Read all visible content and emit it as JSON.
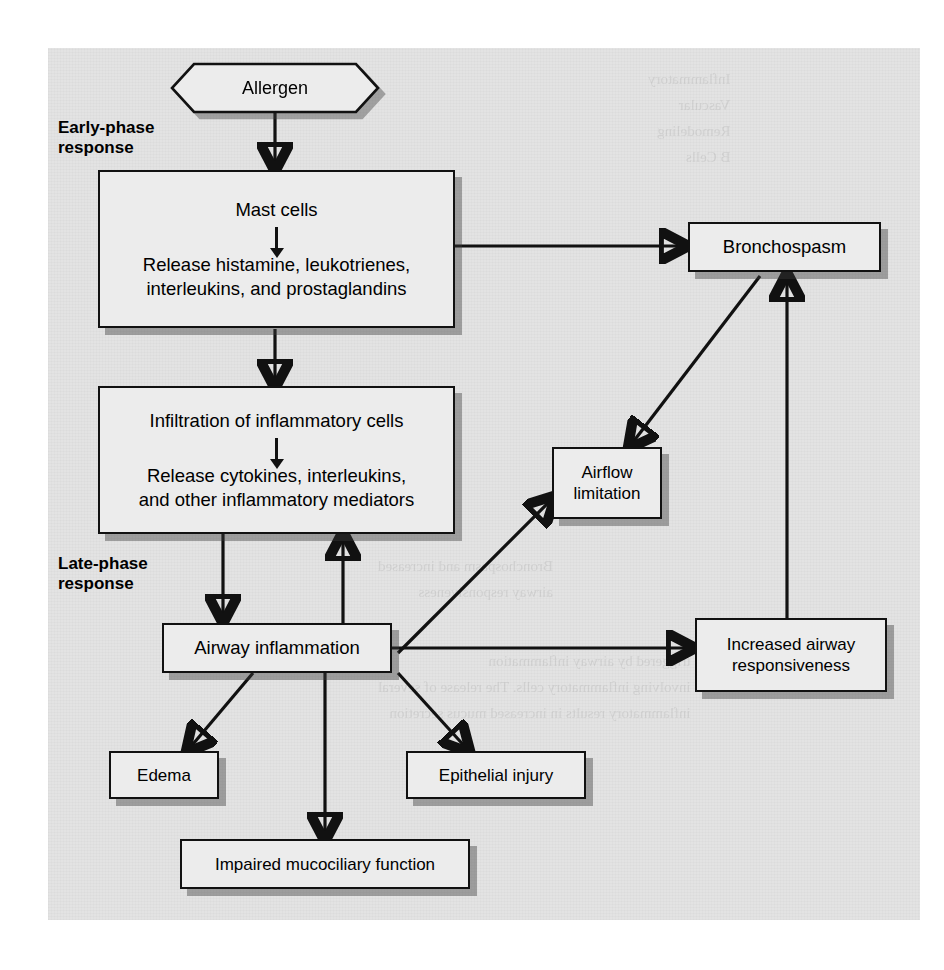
{
  "figure": {
    "panel_bg": "#e3e3e3",
    "box_fill": "#ececec",
    "line_color": "#111111"
  },
  "phase_labels": {
    "early": "Early-phase\nresponse",
    "late": "Late-phase\nresponse"
  },
  "nodes": {
    "allergen": {
      "label": "Allergen"
    },
    "mast_cells": {
      "line1": "Mast cells",
      "line2": "Release histamine, leukotrienes,",
      "line3": "interleukins, and prostaglandins"
    },
    "infiltration": {
      "line1": "Infiltration of inflammatory cells",
      "line2": "Release cytokines, interleukins,",
      "line3": "and other inflammatory mediators"
    },
    "airway_inflammation": {
      "label": "Airway inflammation"
    },
    "bronchospasm": {
      "label": "Bronchospasm"
    },
    "airflow_limitation": {
      "line1": "Airflow",
      "line2": "limitation"
    },
    "increased_responsiveness": {
      "line1": "Increased airway",
      "line2": "responsiveness"
    },
    "edema": {
      "label": "Edema"
    },
    "epithelial_injury": {
      "label": "Epithelial injury"
    },
    "impaired_mucociliary": {
      "label": "Impaired mucociliary function"
    }
  },
  "ghost_text": {
    "top_right": "Inflammatory\nVascular\nRemodeling\nB Cells",
    "mid_right": "Bronchospasm and increased\nairway responsiveness",
    "lower_block": "triggered by airway inflammation\ninvolving inflammatory cells. The release of several\ninflammatory results in increased mucus secretion"
  }
}
